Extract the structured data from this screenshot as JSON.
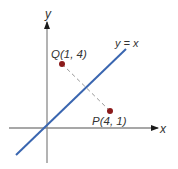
{
  "diagram": {
    "axes": {
      "x_label": "x",
      "y_label": "y",
      "axis_color": "#8a8a8a",
      "arrow_color": "#1a1a1a"
    },
    "line": {
      "label": "y = x",
      "color": "#3a66b0"
    },
    "points": [
      {
        "name": "Q",
        "coords": "(1, 4)",
        "label": "Q(1, 4)",
        "color": "#8b1a1a"
      },
      {
        "name": "P",
        "coords": "(4, 1)",
        "label": "P(4, 1)",
        "color": "#8b1a1a"
      }
    ],
    "segment": {
      "from": "Q",
      "to": "P",
      "style": "dashed",
      "color": "#999999"
    }
  }
}
